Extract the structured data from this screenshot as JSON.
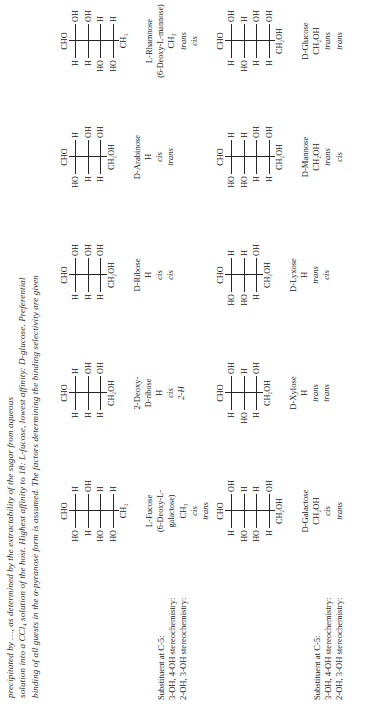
{
  "caption": {
    "text": "solution into a CCl4 solution of the host. Highest affinity to 18: L-fucose, lowest affinity: D-glucose. Preferential binding of all guests in the α-pyranose form is assumed. The factors determining the binding selectivity are given",
    "line1": "precipitated by …, as determined by the extractability of the sugar from aqueous",
    "line2": "solution into a CCl₄ solution of the host. Highest affinity to 18: L-fucose, lowest affinity: D-glucose. Preferential",
    "line3": "binding of all guests in the α-pyranose form is assumed. The factors determining the binding selectivity are given",
    "bold_ref": "18"
  },
  "row_labels": {
    "substituent": "Substituent at C-5:",
    "stereo34": "3-OH, 4-OH stereochemistry:",
    "stereo23": "2-OH, 3-OH stereochemistry:"
  },
  "blocks": [
    {
      "id": "block-1",
      "columns": [
        {
          "name": "L-Fucose",
          "name_line2": "(6-Deoxy-L-",
          "name_line3": "galactose)",
          "substituent": "CH3",
          "substituent_html": "CH₃",
          "stereo34": "cis",
          "stereo23": "trans",
          "fischer": {
            "top": "CHO",
            "bottom": "CH3",
            "bottom_html": "CH₃",
            "centers": [
              {
                "left": "HO",
                "right": "H"
              },
              {
                "left": "H",
                "right": "OH"
              },
              {
                "left": "HO",
                "right": "H"
              },
              {
                "left": "HO",
                "right": "H"
              }
            ]
          }
        },
        {
          "name": "2-Deoxy-",
          "name_line2": "D-ribose",
          "substituent": "H",
          "stereo34": "cis",
          "stereo23": "2-H",
          "fischer": {
            "top": "CHO",
            "bottom": "CH2OH",
            "bottom_html": "CH₂OH",
            "centers": [
              {
                "left": "H",
                "right": "H"
              },
              {
                "left": "H",
                "right": "OH"
              },
              {
                "left": "H",
                "right": "OH"
              }
            ]
          }
        },
        {
          "name": "D-Ribose",
          "name_line2": "",
          "substituent": "H",
          "stereo34": "cis",
          "stereo23": "cis",
          "fischer": {
            "top": "CHO",
            "bottom": "CH2OH",
            "bottom_html": "CH₂OH",
            "centers": [
              {
                "left": "H",
                "right": "OH"
              },
              {
                "left": "H",
                "right": "OH"
              },
              {
                "left": "H",
                "right": "OH"
              }
            ]
          }
        },
        {
          "name": "D-Arabinose",
          "name_line2": "",
          "substituent": "H",
          "stereo34": "cis",
          "stereo23": "trans",
          "fischer": {
            "top": "CHO",
            "bottom": "CH2OH",
            "bottom_html": "CH₂OH",
            "centers": [
              {
                "left": "HO",
                "right": "H"
              },
              {
                "left": "H",
                "right": "OH"
              },
              {
                "left": "H",
                "right": "OH"
              }
            ]
          }
        },
        {
          "name": "L-Rhamnose",
          "name_line2": "(6-Deoxy-L-mannose)",
          "substituent": "CH3",
          "substituent_html": "CH₃",
          "stereo34": "trans",
          "stereo23": "cis",
          "fischer": {
            "top": "CHO",
            "bottom": "CH3",
            "bottom_html": "CH₃",
            "centers": [
              {
                "left": "H",
                "right": "OH"
              },
              {
                "left": "H",
                "right": "OH"
              },
              {
                "left": "HO",
                "right": "H"
              },
              {
                "left": "HO",
                "right": "H"
              }
            ]
          }
        }
      ]
    },
    {
      "id": "block-2",
      "columns": [
        {
          "name": "D-Galactose",
          "name_line2": "",
          "substituent": "CH2OH",
          "substituent_html": "CH₂OH",
          "stereo34": "cis",
          "stereo23": "trans",
          "fischer": {
            "top": "CHO",
            "bottom": "CH2OH",
            "bottom_html": "CH₂OH",
            "centers": [
              {
                "left": "H",
                "right": "OH"
              },
              {
                "left": "HO",
                "right": "H"
              },
              {
                "left": "HO",
                "right": "H"
              },
              {
                "left": "H",
                "right": "OH"
              }
            ]
          }
        },
        {
          "name": "D-Xylose",
          "name_line2": "",
          "substituent": "H",
          "stereo34": "trans",
          "stereo23": "trans",
          "fischer": {
            "top": "CHO",
            "bottom": "CH2OH",
            "bottom_html": "CH₂OH",
            "centers": [
              {
                "left": "H",
                "right": "OH"
              },
              {
                "left": "HO",
                "right": "H"
              },
              {
                "left": "H",
                "right": "OH"
              }
            ]
          }
        },
        {
          "name": "D-Lyxose",
          "name_line2": "",
          "substituent": "H",
          "stereo34": "trans",
          "stereo23": "cis",
          "fischer": {
            "top": "CHO",
            "bottom": "CH2OH",
            "bottom_html": "CH₂OH",
            "centers": [
              {
                "left": "HO",
                "right": "H"
              },
              {
                "left": "HO",
                "right": "H"
              },
              {
                "left": "H",
                "right": "OH"
              }
            ]
          }
        },
        {
          "name": "D-Mannose",
          "name_line2": "",
          "substituent": "CH2OH",
          "substituent_html": "CH₂OH",
          "stereo34": "trans",
          "stereo23": "cis",
          "fischer": {
            "top": "CHO",
            "bottom": "CH2OH",
            "bottom_html": "CH₂OH",
            "centers": [
              {
                "left": "HO",
                "right": "H"
              },
              {
                "left": "HO",
                "right": "H"
              },
              {
                "left": "H",
                "right": "OH"
              },
              {
                "left": "H",
                "right": "OH"
              }
            ]
          }
        },
        {
          "name": "D-Glucose",
          "name_line2": "",
          "substituent": "CH2OH",
          "substituent_html": "CH₂OH",
          "stereo34": "trans",
          "stereo23": "trans",
          "fischer": {
            "top": "CHO",
            "bottom": "CH2OH",
            "bottom_html": "CH₂OH",
            "centers": [
              {
                "left": "H",
                "right": "OH"
              },
              {
                "left": "HO",
                "right": "H"
              },
              {
                "left": "H",
                "right": "OH"
              },
              {
                "left": "H",
                "right": "OH"
              }
            ]
          }
        }
      ]
    }
  ]
}
